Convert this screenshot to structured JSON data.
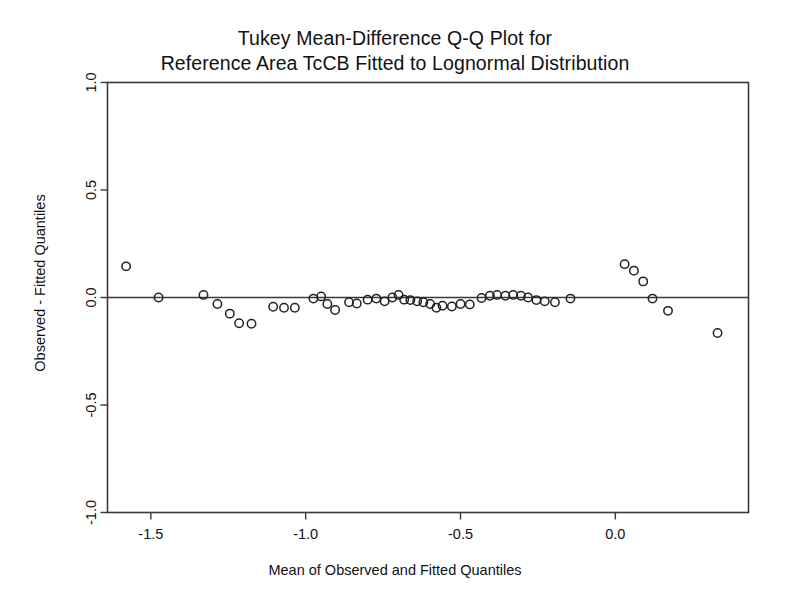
{
  "chart_data": {
    "type": "scatter",
    "title": "Tukey Mean-Difference Q-Q Plot for Reference Area TcCB Fitted to Lognormal Distribution",
    "title_lines": [
      "Tukey Mean-Difference Q-Q Plot for",
      "Reference Area TcCB Fitted to Lognormal Distribution"
    ],
    "xlabel": "Mean of Observed and Fitted Quantiles",
    "ylabel": "Observed - Fitted Quantiles",
    "xlim": [
      -1.64,
      0.43
    ],
    "ylim": [
      -1.0,
      1.0
    ],
    "xticks": [
      -1.5,
      -1.0,
      -0.5,
      0.0
    ],
    "xticklabels": [
      "-1.5",
      "-1.0",
      "-0.5",
      "0.0"
    ],
    "yticks": [
      -1.0,
      -0.5,
      0.0,
      0.5,
      1.0
    ],
    "yticklabels": [
      "-1.0",
      "-0.5",
      "0.0",
      "0.5",
      "1.0"
    ],
    "grid": false,
    "legend": null,
    "reference_line": {
      "y": 0.0,
      "label": "zero-difference-line"
    },
    "marker": {
      "shape": "open-circle",
      "radius_px": 4.2,
      "color": "#222222"
    },
    "series": [
      {
        "name": "Observed minus Fitted",
        "points": [
          [
            -1.58,
            0.145
          ],
          [
            -1.475,
            0.0
          ],
          [
            -1.33,
            0.012
          ],
          [
            -1.285,
            -0.03
          ],
          [
            -1.245,
            -0.075
          ],
          [
            -1.215,
            -0.12
          ],
          [
            -1.175,
            -0.122
          ],
          [
            -1.105,
            -0.043
          ],
          [
            -1.07,
            -0.048
          ],
          [
            -1.035,
            -0.048
          ],
          [
            -0.975,
            -0.005
          ],
          [
            -0.95,
            0.005
          ],
          [
            -0.93,
            -0.03
          ],
          [
            -0.905,
            -0.058
          ],
          [
            -0.86,
            -0.022
          ],
          [
            -0.835,
            -0.028
          ],
          [
            -0.8,
            -0.01
          ],
          [
            -0.772,
            -0.005
          ],
          [
            -0.745,
            -0.018
          ],
          [
            -0.72,
            0.0
          ],
          [
            -0.7,
            0.012
          ],
          [
            -0.682,
            -0.01
          ],
          [
            -0.662,
            -0.012
          ],
          [
            -0.64,
            -0.018
          ],
          [
            -0.62,
            -0.022
          ],
          [
            -0.598,
            -0.03
          ],
          [
            -0.578,
            -0.048
          ],
          [
            -0.558,
            -0.038
          ],
          [
            -0.528,
            -0.042
          ],
          [
            -0.5,
            -0.03
          ],
          [
            -0.47,
            -0.032
          ],
          [
            -0.432,
            -0.002
          ],
          [
            -0.405,
            0.008
          ],
          [
            -0.382,
            0.012
          ],
          [
            -0.355,
            0.008
          ],
          [
            -0.33,
            0.012
          ],
          [
            -0.305,
            0.008
          ],
          [
            -0.282,
            0.0
          ],
          [
            -0.255,
            -0.012
          ],
          [
            -0.228,
            -0.018
          ],
          [
            -0.195,
            -0.022
          ],
          [
            -0.145,
            -0.005
          ],
          [
            0.03,
            0.155
          ],
          [
            0.06,
            0.125
          ],
          [
            0.09,
            0.075
          ],
          [
            0.12,
            -0.005
          ],
          [
            0.17,
            -0.062
          ],
          [
            0.33,
            -0.165
          ]
        ]
      }
    ]
  }
}
